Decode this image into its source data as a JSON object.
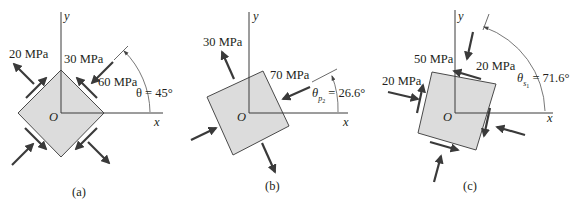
{
  "figure": {
    "colors": {
      "element_fill": "#dcdcdc",
      "element_stroke": "#4a4a4a",
      "arrow": "#3a3a3a",
      "text": "#231f20"
    },
    "panels": [
      {
        "id": "a",
        "caption": "(a)",
        "axes": {
          "x": "x",
          "y": "y",
          "origin": "O"
        },
        "angle_label": "θ = 45°",
        "angle_deg": 45,
        "stress_labels": [
          "20 MPa",
          "30 MPa",
          "60 MPa"
        ],
        "stresses": {
          "normal_tensile": "20 MPa",
          "shear": "30 MPa",
          "normal_compressive": "60 MPa"
        }
      },
      {
        "id": "b",
        "caption": "(b)",
        "axes": {
          "x": "x",
          "y": "y",
          "origin": "O"
        },
        "angle_label_symbol": "θ",
        "angle_label_sub": "p",
        "angle_label_subsub": "2",
        "angle_label_value": " = 26.6°",
        "angle_deg": 26.6,
        "stress_labels": [
          "30 MPa",
          "70 MPa"
        ],
        "stresses": {
          "principal_tensile": "30 MPa",
          "principal_compressive": "70 MPa"
        }
      },
      {
        "id": "c",
        "caption": "(c)",
        "axes": {
          "x": "x",
          "y": "y",
          "origin": "O"
        },
        "angle_label_symbol": "θ",
        "angle_label_sub": "s",
        "angle_label_subsub": "1",
        "angle_label_value": " = 71.6°",
        "angle_deg": 71.6,
        "stress_labels": [
          "50 MPa",
          "20 MPa",
          "20 MPa"
        ],
        "stresses": {
          "max_shear": "50 MPa",
          "avg_normal_top": "20 MPa",
          "avg_normal_left": "20 MPa"
        }
      }
    ]
  }
}
